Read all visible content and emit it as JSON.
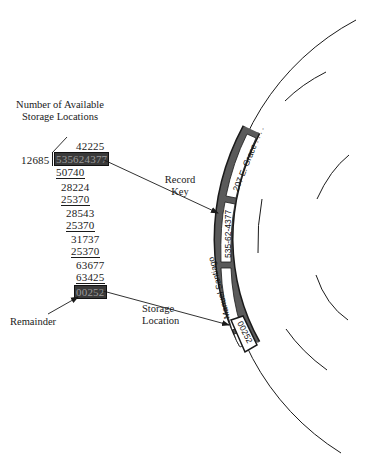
{
  "labels": {
    "available_locations_line1": "Number of Available",
    "available_locations_line2": "Storage Locations",
    "record_key_line1": "Record",
    "record_key_line2": "Key",
    "storage_location_line1": "Storage",
    "storage_location_line2": "Location",
    "remainder": "Remainder"
  },
  "division": {
    "divisor": "12685",
    "quotient": "42225",
    "dividend": "535624377",
    "steps": [
      {
        "value": "50740",
        "underline": true
      },
      {
        "value": "28224",
        "underline": false
      },
      {
        "value": "25370",
        "underline": true
      },
      {
        "value": "28543",
        "underline": false
      },
      {
        "value": "25370",
        "underline": true
      },
      {
        "value": "31737",
        "underline": false
      },
      {
        "value": "25370",
        "underline": true
      },
      {
        "value": "63677",
        "underline": false
      },
      {
        "value": "63425",
        "underline": true
      }
    ],
    "remainder": "00252"
  },
  "track_records": {
    "address": "207 E. Grace . . . .",
    "key": "535-62-4377",
    "name": "Manuel Santiago",
    "location": "00252"
  },
  "colors": {
    "ink": "#1a1a1a",
    "highlight_fill": "#3a3a3a",
    "highlight_text": "#9a9a9a",
    "track_fill": "#5a5a5a"
  }
}
